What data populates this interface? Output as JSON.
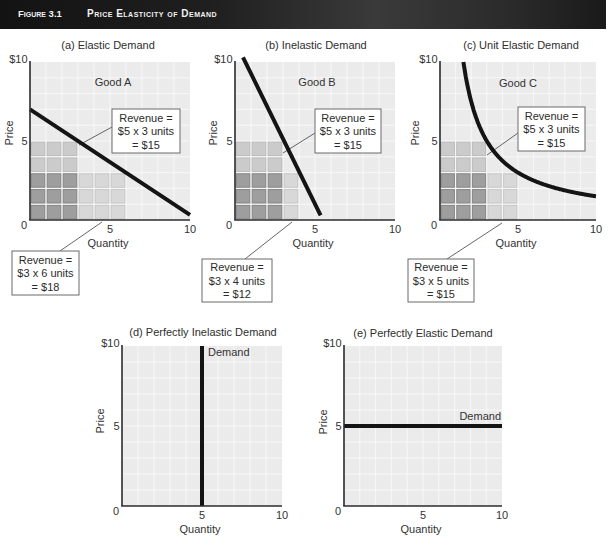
{
  "header": {
    "figure_label": "Figure 3.1",
    "title": "Price Elasticity of Demand"
  },
  "colors": {
    "header_bg": "#1c1c1c",
    "plot_bg": "#ebebeb",
    "grid": "#f8f8f8",
    "axis": "#2b2b2b",
    "demand_line": "#141414",
    "cell_overlap": "#9e9e9e",
    "cell_price_only": "#cbcbcb",
    "cell_quantity_only": "#d8d8d8",
    "annotation_border": "#6a6a6a"
  },
  "chart_data": [
    {
      "id": "a",
      "type": "line",
      "title": "(a) Elastic Demand",
      "good_label": "Good A",
      "xlabel": "Quantity",
      "ylabel": "Price",
      "xlim": [
        0,
        10
      ],
      "ylim": [
        0,
        10
      ],
      "grid": true,
      "origin_label": "0",
      "x_ticks": [
        {
          "v": 5,
          "label": "5"
        },
        {
          "v": 10,
          "label": "10"
        }
      ],
      "y_ticks": [
        {
          "v": 5,
          "label": "5"
        },
        {
          "v": 10,
          "label": "$10"
        }
      ],
      "series": [
        {
          "name": "Demand",
          "shape": "line",
          "points": [
            [
              0,
              7
            ],
            [
              10,
              0.33
            ]
          ]
        }
      ],
      "revenue_rects": [
        {
          "quantity": 3,
          "price": 5,
          "revenue": 15
        },
        {
          "quantity": 6,
          "price": 3,
          "revenue": 18
        }
      ],
      "annotations": [
        {
          "lines": [
            "Revenue =",
            "$5 x 3 units",
            "= $15"
          ]
        },
        {
          "lines": [
            "Revenue =",
            "$3 x 6 units",
            "= $18"
          ]
        }
      ]
    },
    {
      "id": "b",
      "type": "line",
      "title": "(b) Inelastic Demand",
      "good_label": "Good B",
      "xlabel": "Quantity",
      "ylabel": "Price",
      "xlim": [
        0,
        10
      ],
      "ylim": [
        0,
        10
      ],
      "grid": true,
      "origin_label": "0",
      "x_ticks": [
        {
          "v": 5,
          "label": "5"
        },
        {
          "v": 10,
          "label": "10"
        }
      ],
      "y_ticks": [
        {
          "v": 5,
          "label": "5"
        },
        {
          "v": 10,
          "label": "$10"
        }
      ],
      "series": [
        {
          "name": "Demand",
          "shape": "line",
          "points": [
            [
              0.5,
              10.3
            ],
            [
              5.35,
              0.3
            ]
          ]
        }
      ],
      "revenue_rects": [
        {
          "quantity": 3,
          "price": 5,
          "revenue": 15
        },
        {
          "quantity": 4,
          "price": 3,
          "revenue": 12
        }
      ],
      "annotations": [
        {
          "lines": [
            "Revenue =",
            "$5 x 3 units",
            "= $15"
          ]
        },
        {
          "lines": [
            "Revenue =",
            "$3 x 4 units",
            "= $12"
          ]
        }
      ]
    },
    {
      "id": "c",
      "type": "line",
      "title": "(c) Unit Elastic Demand",
      "good_label": "Good C",
      "xlabel": "Quantity",
      "ylabel": "Price",
      "xlim": [
        0,
        10
      ],
      "ylim": [
        0,
        10
      ],
      "grid": true,
      "origin_label": "0",
      "x_ticks": [
        {
          "v": 5,
          "label": "5"
        },
        {
          "v": 10,
          "label": "10"
        }
      ],
      "y_ticks": [
        {
          "v": 5,
          "label": "5"
        },
        {
          "v": 10,
          "label": "$10"
        }
      ],
      "series": [
        {
          "name": "Demand",
          "shape": "curve",
          "k": 15,
          "q_range": [
            1.5,
            10
          ]
        }
      ],
      "revenue_rects": [
        {
          "quantity": 3,
          "price": 5,
          "revenue": 15
        },
        {
          "quantity": 5,
          "price": 3,
          "revenue": 15
        }
      ],
      "annotations": [
        {
          "lines": [
            "Revenue =",
            "$5 x 3 units",
            "= $15"
          ]
        },
        {
          "lines": [
            "Revenue =",
            "$3 x 5 units",
            "= $15"
          ]
        }
      ]
    },
    {
      "id": "d",
      "type": "line",
      "title": "(d) Perfectly Inelastic Demand",
      "xlabel": "Quantity",
      "ylabel": "Price",
      "xlim": [
        0,
        10
      ],
      "ylim": [
        0,
        10
      ],
      "grid": true,
      "origin_label": "0",
      "x_ticks": [
        {
          "v": 5,
          "label": "5"
        },
        {
          "v": 10,
          "label": "10"
        }
      ],
      "y_ticks": [
        {
          "v": 5,
          "label": "5"
        },
        {
          "v": 10,
          "label": "$10"
        }
      ],
      "series": [
        {
          "name": "Demand",
          "shape": "line",
          "points": [
            [
              5,
              0
            ],
            [
              5,
              10
            ]
          ]
        }
      ],
      "demand_label": "Demand"
    },
    {
      "id": "e",
      "type": "line",
      "title": "(e) Perfectly Elastic Demand",
      "xlabel": "Quantity",
      "ylabel": "Price",
      "xlim": [
        0,
        10
      ],
      "ylim": [
        0,
        10
      ],
      "grid": true,
      "origin_label": "0",
      "x_ticks": [
        {
          "v": 5,
          "label": "5"
        },
        {
          "v": 10,
          "label": "10"
        }
      ],
      "y_ticks": [
        {
          "v": 5,
          "label": "5"
        },
        {
          "v": 10,
          "label": "$10"
        }
      ],
      "series": [
        {
          "name": "Demand",
          "shape": "line",
          "points": [
            [
              0,
              5
            ],
            [
              10,
              5
            ]
          ]
        }
      ],
      "demand_label": "Demand"
    }
  ]
}
